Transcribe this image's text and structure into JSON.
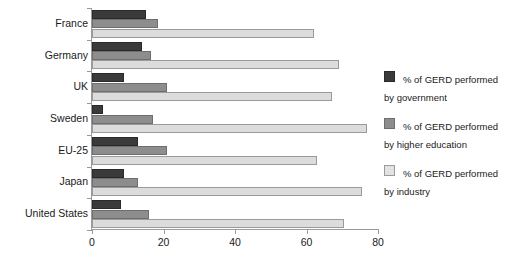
{
  "chart_data": {
    "type": "bar",
    "orientation": "horizontal",
    "title": "",
    "subtitle": "",
    "xlabel": "",
    "ylabel": "",
    "xlim": [
      0,
      80
    ],
    "xticks": [
      0,
      20,
      40,
      60,
      80
    ],
    "xtick_labels": [
      "0",
      "20",
      "40",
      "60",
      "80"
    ],
    "grid": false,
    "legend_position": "right",
    "categories": [
      "France",
      "Germany",
      "UK",
      "Sweden",
      "EU-25",
      "Japan",
      "United States"
    ],
    "series": [
      {
        "name": "% of GERD performed by government",
        "legend_label": "% of GERD performed\nby government",
        "key": "gov",
        "color": "#3a3a3a",
        "values": [
          15,
          14,
          9,
          3,
          13,
          9,
          8
        ]
      },
      {
        "name": "% of GERD performed by higher education",
        "legend_label": "% of GERD performed\nby higher education",
        "key": "he",
        "color": "#8d8d8d",
        "values": [
          18.5,
          16.5,
          21,
          17,
          21,
          13,
          16
        ]
      },
      {
        "name": "% of GERD performed by industry",
        "legend_label": "% of GERD performed\nby industry",
        "key": "ind",
        "color": "#dcdcdc",
        "values": [
          62,
          69,
          67,
          77,
          63,
          75.5,
          70.5
        ]
      }
    ]
  },
  "legend": {
    "entries": [
      {
        "label": "% of GERD performed\nby government",
        "swatch": "gov"
      },
      {
        "label": "% of GERD performed\nby higher education",
        "swatch": "he"
      },
      {
        "label": "% of GERD performed\nby industry",
        "swatch": "ind"
      }
    ]
  }
}
